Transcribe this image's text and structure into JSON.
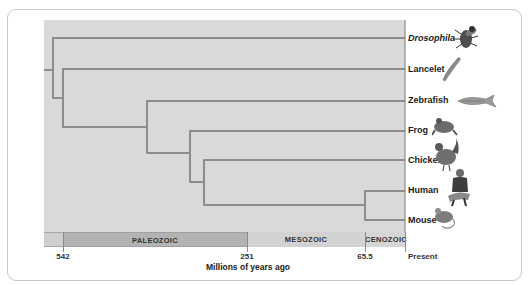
{
  "diagram": {
    "type": "phylogenetic-tree",
    "taxa": [
      {
        "name": "Drosophila",
        "italic": true,
        "icon": "fly-icon"
      },
      {
        "name": "Lancelet",
        "italic": false,
        "icon": "lancelet-icon"
      },
      {
        "name": "Zebrafish",
        "italic": false,
        "icon": "fish-icon"
      },
      {
        "name": "Frog",
        "italic": false,
        "icon": "frog-icon"
      },
      {
        "name": "Chicken",
        "italic": false,
        "icon": "chicken-icon"
      },
      {
        "name": "Human",
        "italic": false,
        "icon": "human-icon"
      },
      {
        "name": "Mouse",
        "italic": false,
        "icon": "mouse-icon"
      }
    ],
    "eras": [
      {
        "name": "PALEOZOIC"
      },
      {
        "name": "MESOZOIC"
      },
      {
        "name": "CENOZOIC"
      }
    ],
    "ticks": [
      {
        "label": "542"
      },
      {
        "label": "251"
      },
      {
        "label": "65.5"
      },
      {
        "label": "Present"
      }
    ],
    "axis_label": "Millions of years ago",
    "colors": {
      "plot_background": "#d9d9d9",
      "branch": "#8c8c8c",
      "paleozoic": "#b3b3b3",
      "mesozoic": "#d2d2d2",
      "cenozoic": "#d6d6d6"
    }
  }
}
